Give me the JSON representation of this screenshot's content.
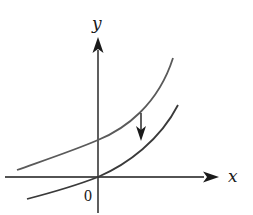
{
  "figure": {
    "type": "function-graph-transformation",
    "axes": {
      "x_label": "x",
      "y_label": "y",
      "origin_label": "0"
    },
    "curves": [
      {
        "name": "original-curve",
        "description": "upper increasing curve, positive y-intercept",
        "color": "#555555"
      },
      {
        "name": "shifted-curve",
        "description": "lower increasing curve passing through origin",
        "color": "#333333"
      }
    ],
    "annotations": [
      {
        "name": "shift-down-arrow",
        "direction": "down",
        "meaning": "vertical translation downward"
      }
    ],
    "colors": {
      "axis": "#1a1a1a",
      "upper_curve": "#5a5a5a",
      "lower_curve": "#3a3a3a",
      "background": "#ffffff"
    }
  }
}
